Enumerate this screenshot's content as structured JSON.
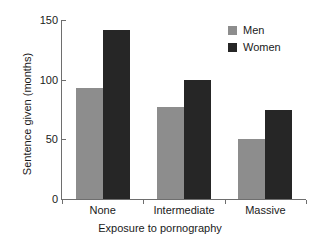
{
  "chart_data": {
    "type": "bar",
    "title": "",
    "subtitle": "",
    "xlabel": "Exposure to pornography",
    "ylabel": "Sentence given (months)",
    "categories": [
      "None",
      "Intermediate",
      "Massive"
    ],
    "series": [
      {
        "name": "Men",
        "color": "#8d8d8d",
        "values": [
          93,
          77,
          50
        ]
      },
      {
        "name": "Women",
        "color": "#262626",
        "values": [
          142,
          100,
          75
        ]
      }
    ],
    "ylim": [
      0,
      150
    ],
    "yticks": [
      0,
      50,
      100,
      150
    ],
    "ytick_labels": [
      "0",
      "50",
      "100",
      "150"
    ],
    "grid": false,
    "legend_position": "top-right",
    "legend_entries": [
      "Men",
      "Women"
    ],
    "background": "#ffffff",
    "axis_color": "#6e6e6e",
    "text_color": "#1a1a1a",
    "bar_grouping": "grouped-adjacent"
  }
}
